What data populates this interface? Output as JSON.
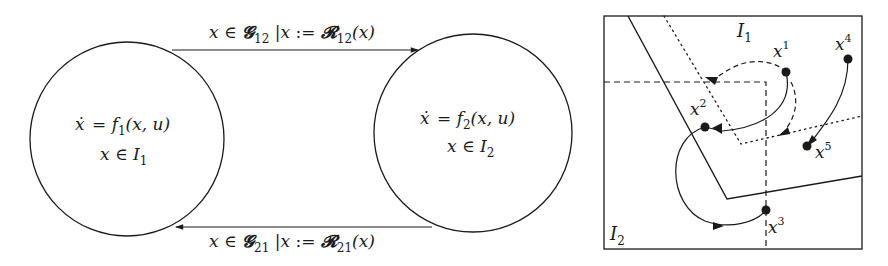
{
  "hybrid_automaton": {
    "modes": [
      {
        "id": "q1",
        "dynamics": {
          "lhs": "ẋ",
          "eq": "=",
          "f": "f",
          "sub": "1",
          "args": "(x, u)"
        },
        "invariant": {
          "var": "x",
          "in": "∈",
          "set": "I",
          "sub": "1"
        }
      },
      {
        "id": "q2",
        "dynamics": {
          "lhs": "ẋ",
          "eq": "=",
          "f": "f",
          "sub": "2",
          "args": "(x, u)"
        },
        "invariant": {
          "var": "x",
          "in": "∈",
          "set": "I",
          "sub": "2"
        }
      }
    ],
    "transitions": [
      {
        "from": "q1",
        "to": "q2",
        "guard": {
          "var": "x",
          "in": "∈",
          "set": "𝓖",
          "sub": "12"
        },
        "separator": "|",
        "reset": {
          "var": "x",
          "assign": ":=",
          "map": "𝓡",
          "sub": "12",
          "arg": "(x)"
        }
      },
      {
        "from": "q2",
        "to": "q1",
        "guard": {
          "var": "x",
          "in": "∈",
          "set": "𝓖",
          "sub": "21"
        },
        "separator": "|",
        "reset": {
          "var": "x",
          "assign": ":=",
          "map": "𝓡",
          "sub": "21",
          "arg": "(x)"
        }
      }
    ]
  },
  "state_space": {
    "regions": [
      {
        "label": "I",
        "sub": "1"
      },
      {
        "label": "I",
        "sub": "2"
      }
    ],
    "points": [
      {
        "label": "x",
        "sup": "1"
      },
      {
        "label": "x",
        "sup": "2"
      },
      {
        "label": "x",
        "sup": "3"
      },
      {
        "label": "x",
        "sup": "4"
      },
      {
        "label": "x",
        "sup": "5"
      }
    ],
    "line_styles": {
      "invariant_boundary": "solid",
      "guard_boundary_dashed": "dashed",
      "guard_boundary_dotted": "dotted",
      "trajectory": "solid",
      "reset_jump": "dashed"
    }
  },
  "colors": {
    "stroke": "#1a1a1a",
    "background": "#ffffff"
  }
}
